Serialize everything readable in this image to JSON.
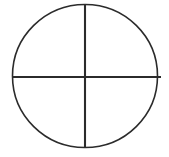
{
  "figure": {
    "background_color": "#ffffff",
    "stroke_color": "#2b2b2b",
    "canvas": {
      "width": 169,
      "height": 157
    },
    "shapes": {
      "circle": {
        "name": "circle-outline",
        "center_x": 85,
        "center_y": 76,
        "radius_x": 72.5,
        "radius_y": 71.5,
        "stroke_width": 1.6,
        "fill": "none"
      },
      "vertical_diameter": {
        "name": "vertical-diameter-line",
        "x1": 85,
        "y1": 4,
        "x2": 85,
        "y2": 148,
        "stroke_width": 2.1
      },
      "horizontal_diameter": {
        "name": "horizontal-diameter-line",
        "x1": 12,
        "y1": 77,
        "x2": 161,
        "y2": 77,
        "stroke_width": 2.1
      }
    },
    "quadrants": [
      {
        "name": "top-left-quadrant"
      },
      {
        "name": "top-right-quadrant"
      },
      {
        "name": "bottom-left-quadrant"
      },
      {
        "name": "bottom-right-quadrant"
      }
    ]
  }
}
